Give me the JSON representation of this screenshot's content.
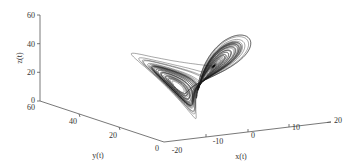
{
  "chart_data": {
    "type": "line",
    "title": "",
    "subtitle": "Lorenz attractor trajectory (3D)",
    "xlabel": "x(t)",
    "ylabel": "y(t)",
    "zlabel": "z(t)",
    "x_ticks": [
      "-20",
      "-10",
      "0",
      "10",
      "20"
    ],
    "y_ticks": [
      "60",
      "40",
      "20",
      "0"
    ],
    "z_ticks": [
      "60",
      "40",
      "20",
      "0"
    ],
    "xlim": [
      -20,
      20
    ],
    "ylim": [
      0,
      60
    ],
    "zlim": [
      0,
      60
    ],
    "grid": false,
    "legend": null,
    "series": [
      {
        "name": "trajectory",
        "color": "#1a1a1a",
        "description": "Lorenz system, two-lobed butterfly attractor"
      }
    ]
  },
  "colors": {
    "line": "#1a1a1a",
    "axis": "#555555",
    "background": "#ffffff"
  }
}
